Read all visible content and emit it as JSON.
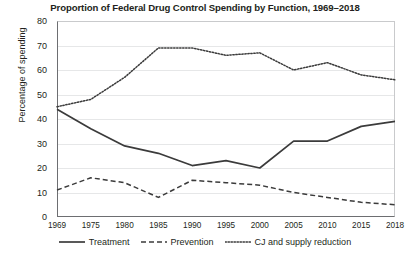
{
  "chart_data": {
    "type": "line",
    "title": "Proportion of Federal Drug Control Spending by Function, 1969–2018",
    "xlabel": "",
    "ylabel": "Percentage of spending",
    "x": [
      1969,
      1975,
      1980,
      1985,
      1990,
      1995,
      2000,
      2005,
      2010,
      2015,
      2018
    ],
    "xtick_labels": [
      "1969",
      "1975",
      "1980",
      "1985",
      "1990",
      "1995",
      "2000",
      "2005",
      "2010",
      "2015",
      "2018"
    ],
    "ytick_labels": [
      "0",
      "10",
      "20",
      "30",
      "40",
      "50",
      "60",
      "70",
      "80"
    ],
    "yticks": [
      0,
      10,
      20,
      30,
      40,
      50,
      60,
      70,
      80
    ],
    "ylim": [
      0,
      80
    ],
    "grid": true,
    "legend_position": "bottom",
    "series": [
      {
        "name": "Treatment",
        "style": "solid",
        "color": "#3b3b3b",
        "values": [
          44,
          36,
          29,
          26,
          21,
          23,
          20,
          31,
          31,
          37,
          39
        ]
      },
      {
        "name": "Prevention",
        "style": "dashed",
        "color": "#3b3b3b",
        "values": [
          11,
          16,
          14,
          8,
          15,
          14,
          13,
          10,
          8,
          6,
          5
        ]
      },
      {
        "name": "CJ and supply reduction",
        "style": "dotted",
        "color": "#3b3b3b",
        "values": [
          45,
          48,
          57,
          69,
          69,
          66,
          67,
          60,
          63,
          58,
          56
        ]
      }
    ]
  },
  "legend": {
    "items": [
      {
        "label": "Treatment",
        "icon": "solid-line-icon"
      },
      {
        "label": "Prevention",
        "icon": "dashed-line-icon"
      },
      {
        "label": "CJ and supply reduction",
        "icon": "dotted-line-icon"
      }
    ]
  }
}
